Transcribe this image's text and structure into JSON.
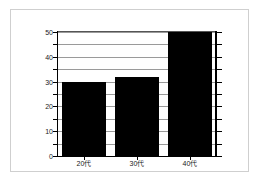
{
  "chart_data": {
    "type": "bar",
    "title": "",
    "subtitle": "",
    "xlabel": "",
    "ylabel": "",
    "categories": [
      "20代",
      "30代",
      "40代"
    ],
    "values": [
      30,
      32,
      50
    ],
    "series": [
      {
        "name": "",
        "values": [
          30,
          32,
          50
        ]
      }
    ],
    "ylim": [
      0,
      50
    ],
    "y_major_ticks": [
      0,
      10,
      20,
      30,
      40,
      50
    ],
    "y_major_tick_labels": [
      "0",
      "10",
      "20",
      "30",
      "40",
      "50"
    ],
    "y_minor_ticks": [
      5,
      15,
      25,
      35,
      45
    ],
    "gridlines": [
      5,
      10,
      15,
      20,
      25,
      30,
      35,
      40,
      45,
      50
    ],
    "grid": true,
    "grid_axis": "y",
    "legend": false,
    "legend_position": "none",
    "bar_color": "#000000",
    "grid_color": "#9a9a9a",
    "axis_color": "#000000",
    "background_color": "#ffffff",
    "frame_border_color": "#cfcfcf",
    "right_axis_ticks": true,
    "right_axis_labeled": false,
    "annotations": []
  },
  "figure": {
    "background_color": "#ffffff",
    "border_color": "#cfcfcf"
  }
}
